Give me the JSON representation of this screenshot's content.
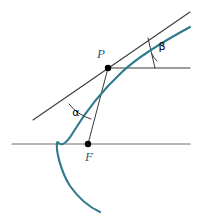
{
  "figure": {
    "kind": "geometry-diagram",
    "background_color": "#ffffff",
    "width": 198,
    "height": 219
  },
  "colors": {
    "curve": "#2d7a8c",
    "axis": "#6e6e6e",
    "construction_line": "#3a3a3a",
    "point_fill": "#000000",
    "label_text": "#1f5f77",
    "angle_text": "#000000"
  },
  "points": [
    {
      "id": "P",
      "label": "P",
      "x": 108,
      "y": 68,
      "label_x": 101,
      "label_y": 55,
      "description": "point on the parabola where the tangent is drawn"
    },
    {
      "id": "F",
      "label": "F",
      "x": 88,
      "y": 144,
      "label_x": 89,
      "label_y": 158,
      "description": "focus of the parabola, on the horizontal axis"
    }
  ],
  "angles": [
    {
      "id": "alpha",
      "label": "α",
      "label_x": 76,
      "label_y": 113,
      "vertex": "P",
      "between": [
        "tangent-line",
        "focal-radius-FP"
      ],
      "description": "angle at P between the tangent line and the focal radius FP"
    },
    {
      "id": "beta",
      "label": "β",
      "label_x": 162,
      "label_y": 47,
      "vertex_x": 155,
      "vertex_y": 68,
      "between": [
        "horizontal-ray",
        "tangent-line"
      ],
      "description": "angle between the horizontal ray through P and the tangent line"
    }
  ],
  "curve": {
    "name": "parabola",
    "color": "#2d7a8c",
    "stroke_width": 2.1,
    "vertex_x": 57,
    "vertex_y": 143,
    "path": "M 190,27 C 166,40 140,55 122,72 C 106,87 88,108 74,131 C 60,155 58,138 57,143 C 56,150 60,170 70,186 C 80,200 91,208 100,212"
  },
  "lines": {
    "lower_axis": {
      "name": "horizontal-axis-through-focus",
      "x1": 12,
      "y1": 144,
      "x2": 190,
      "y2": 144,
      "color": "#6e6e6e",
      "stroke_width": 1.2
    },
    "upper_ray": {
      "name": "horizontal-ray-through-P",
      "x1": 108,
      "y1": 68,
      "x2": 190,
      "y2": 68,
      "color": "#3a3a3a",
      "stroke_width": 1.1
    },
    "tangent": {
      "name": "tangent-line-at-P",
      "x1": 33,
      "y1": 120,
      "x2": 190,
      "y2": 12,
      "color": "#3a3a3a",
      "stroke_width": 1.1
    },
    "focal_radius": {
      "name": "focal-radius-F-to-P",
      "x1": 88,
      "y1": 144,
      "x2": 108,
      "y2": 68,
      "color": "#3a3a3a",
      "stroke_width": 1.0
    },
    "beta_leg": {
      "name": "beta-angle-vertical-leg",
      "x1": 155,
      "y1": 68,
      "x2": 148,
      "y2": 38,
      "color": "#3a3a3a",
      "stroke_width": 1.0
    }
  },
  "arcs": {
    "alpha_arc": {
      "name": "alpha-angle-arc",
      "path": "M 69,104 A 45,45 0 0 0 91,119",
      "color": "#3a3a3a",
      "stroke_width": 1.0
    },
    "beta_arc": {
      "name": "beta-angle-arc",
      "path": "M 152,54 A 20,20 0 0 0 157,61",
      "color": "#3a3a3a",
      "stroke_width": 1.0
    }
  },
  "point_radius": 3.2
}
